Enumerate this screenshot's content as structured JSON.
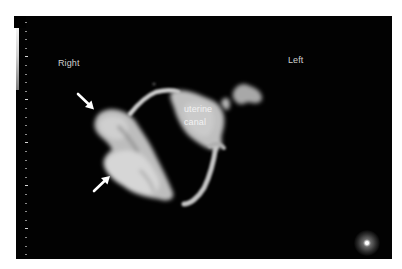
{
  "image": {
    "type": "3D ultrasound rendering",
    "background_color": "#020202",
    "structure_color": "#c8c8c8"
  },
  "annotations": {
    "side_right": "Right",
    "side_left": "Left",
    "structure_label_line1": "uterine",
    "structure_label_line2": "canal"
  },
  "arrows": [
    {
      "id": "upper-arrow",
      "direction": "down-right",
      "color": "#ffffff"
    },
    {
      "id": "lower-arrow",
      "direction": "up-right",
      "color": "#ffffff"
    }
  ],
  "indicators": {
    "gray_scale_bar": "white-to-gray gradient",
    "depth_ticks": 28,
    "light_source_orb": "bottom-right"
  }
}
